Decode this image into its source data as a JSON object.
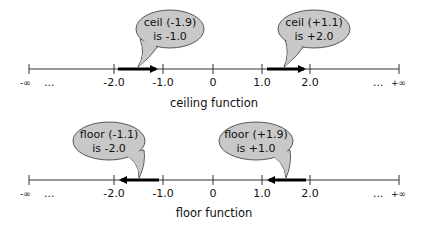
{
  "diagrams": [
    {
      "caption": "ceiling function",
      "axis": {
        "left_end": "-∞",
        "left_dots": "...",
        "right_dots": "...",
        "right_end": "+∞",
        "ticks": [
          "-2.0",
          "-1.0",
          "0",
          "1.0",
          "2.0"
        ]
      },
      "callouts": [
        {
          "line1": "ceil (-1.9)",
          "line2": "is -1.0",
          "arrow_from": -1.9,
          "arrow_to": -1.0,
          "direction": "right"
        },
        {
          "line1": "ceil (+1.1)",
          "line2": "is +2.0",
          "arrow_from": 1.1,
          "arrow_to": 2.0,
          "direction": "right"
        }
      ]
    },
    {
      "caption": "floor function",
      "axis": {
        "left_end": "-∞",
        "left_dots": "...",
        "right_dots": "...",
        "right_end": "+∞",
        "ticks": [
          "-2.0",
          "-1.0",
          "0",
          "1.0",
          "2.0"
        ]
      },
      "callouts": [
        {
          "line1": "floor (-1.1)",
          "line2": "is -2.0",
          "arrow_from": -1.1,
          "arrow_to": -2.0,
          "direction": "left"
        },
        {
          "line1": "floor (+1.9)",
          "line2": "is +1.0",
          "arrow_from": 1.9,
          "arrow_to": 1.0,
          "direction": "left"
        }
      ]
    }
  ],
  "colors": {
    "bubble_fill": "#c8c8c8",
    "line": "#333333",
    "arrow": "#000000"
  }
}
